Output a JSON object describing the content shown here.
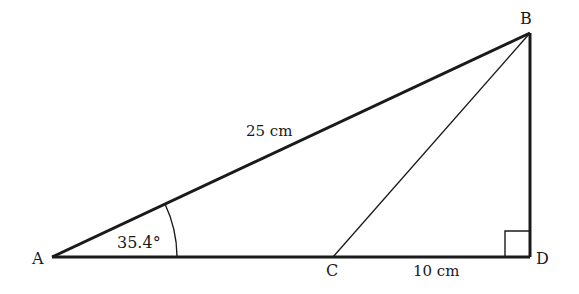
{
  "diagram": {
    "type": "geometry-triangle",
    "points": {
      "A": {
        "label": "A",
        "x": 52,
        "y": 257
      },
      "B": {
        "label": "B",
        "x": 530,
        "y": 33
      },
      "C": {
        "label": "C",
        "x": 333,
        "y": 257
      },
      "D": {
        "label": "D",
        "x": 530,
        "y": 257
      }
    },
    "labels": {
      "hypotenuse": "25 cm",
      "cd_length": "10 cm",
      "angle_a": "35.4°"
    },
    "right_angle_at": "D",
    "colors": {
      "stroke": "#1a1a1a",
      "background": "#ffffff"
    }
  }
}
